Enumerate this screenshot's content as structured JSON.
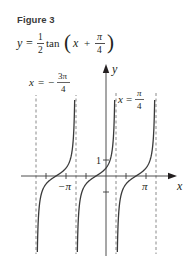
{
  "figure": {
    "label": "Figure 3",
    "equation": {
      "lhs": "y",
      "coef_num": "1",
      "coef_den": "2",
      "func": "tan",
      "arg_var": "x",
      "arg_op": "+",
      "arg_num": "π",
      "arg_den": "4"
    }
  },
  "axes": {
    "x_label": "x",
    "y_label": "y",
    "x_ticks": [
      {
        "label": "−π",
        "value": -3.14159
      },
      {
        "label": "π",
        "value": 3.14159
      }
    ],
    "y_ticks": [
      {
        "label": "1",
        "value": 1
      },
      {
        "label": "",
        "value": -1
      }
    ]
  },
  "asymptotes": {
    "left_label": {
      "lhs": "x",
      "sign": "−",
      "num": "3π",
      "den": "4"
    },
    "right_label": {
      "lhs": "x",
      "num": "π",
      "den": "4"
    }
  },
  "colors": {
    "curve": "#3a3a3a",
    "axis": "#3a3a3a",
    "asymptote": "#8a8a8a"
  },
  "chart_data": {
    "type": "line",
    "function": "0.5*tan(x + pi/4)",
    "xlabel": "x",
    "ylabel": "y",
    "x_tick_labels": [
      "−π",
      "π"
    ],
    "y_tick_labels": [
      "1"
    ],
    "xlim": [
      -3.9,
      2.7
    ],
    "ylim": [
      -5,
      5
    ],
    "period": "π",
    "vertical_asymptotes": [
      "−7π/4",
      "−3π/4",
      "π/4",
      "5π/4"
    ],
    "labeled_asymptotes": [
      "x = −3π/4",
      "x = π/4"
    ],
    "x_intercepts": [
      "−5π/4",
      "−π/4",
      "3π/4"
    ],
    "series": [
      {
        "name": "branch 1",
        "domain": [
          "−7π/4",
          "−3π/4"
        ]
      },
      {
        "name": "branch 2",
        "domain": [
          "−3π/4",
          "π/4"
        ]
      },
      {
        "name": "branch 3",
        "domain": [
          "π/4",
          "5π/4"
        ]
      }
    ],
    "grid": false,
    "legend": null
  }
}
